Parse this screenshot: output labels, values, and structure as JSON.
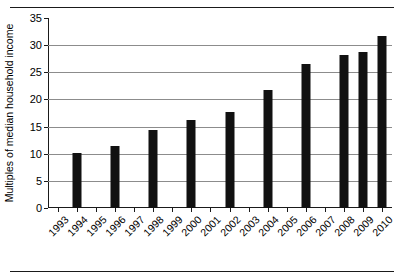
{
  "chart_data": {
    "type": "bar",
    "title": "",
    "xlabel": "",
    "ylabel": "Multiples of median household income",
    "ylim": [
      0,
      35
    ],
    "yticks": [
      0,
      5,
      10,
      15,
      20,
      25,
      30,
      35
    ],
    "grid": true,
    "legend": false,
    "categories": [
      "1993",
      "1994",
      "1995",
      "1996",
      "1997",
      "1998",
      "1999",
      "2000",
      "2001",
      "2002",
      "2003",
      "2004",
      "2005",
      "2006",
      "2007",
      "2008",
      "2009",
      "2010"
    ],
    "values": [
      null,
      10.2,
      null,
      11.5,
      null,
      14.3,
      null,
      16.2,
      null,
      17.7,
      null,
      21.7,
      null,
      26.5,
      null,
      28.2,
      28.8,
      31.6
    ],
    "bar_color": "#111111",
    "gridline_color": "#8c8c8c",
    "axis_color": "#1a1a1a"
  }
}
